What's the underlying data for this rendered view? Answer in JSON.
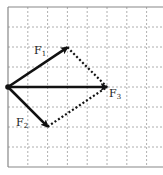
{
  "diagram": {
    "grid": {
      "origin_px": [
        8,
        87
      ],
      "cell_px": 19.8,
      "columns": 8,
      "rows": 8,
      "line_color": "#9a9a9a",
      "border_color": "#888888"
    },
    "vectors": [
      {
        "id": "F1",
        "label": "F",
        "subscript": "1",
        "from": [
          0,
          0
        ],
        "to": [
          3,
          2
        ],
        "style": "solid"
      },
      {
        "id": "F2",
        "label": "F",
        "subscript": "2",
        "from": [
          0,
          0
        ],
        "to": [
          2,
          -2
        ],
        "style": "solid"
      },
      {
        "id": "F3",
        "label": "F",
        "subscript": "3",
        "from": [
          0,
          0
        ],
        "to": [
          5,
          0
        ],
        "style": "solid"
      }
    ],
    "construction_lines": [
      {
        "from": [
          3,
          2
        ],
        "to": [
          5,
          0
        ],
        "style": "dotted"
      },
      {
        "from": [
          2,
          -2
        ],
        "to": [
          5,
          0
        ],
        "style": "dotted"
      }
    ],
    "colors": {
      "vector": "#111111",
      "dotted": "#111111"
    }
  }
}
